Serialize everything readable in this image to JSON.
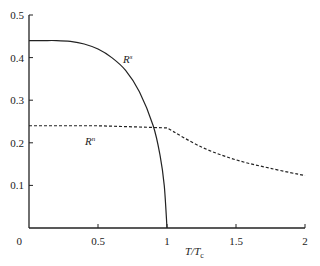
{
  "chart_data": {
    "type": "line",
    "title": "",
    "xlabel": "T/T_c",
    "xlabel_main": "T/T",
    "xlabel_sub": "c",
    "ylabel": "",
    "xlim": [
      0,
      2
    ],
    "ylim": [
      0,
      0.5
    ],
    "grid": false,
    "legend": "inline labels",
    "x_ticks": [
      "0.5",
      "1",
      "1.5",
      "2"
    ],
    "y_ticks": [
      "0.1",
      "0.2",
      "0.3",
      "0.4",
      "0.5"
    ],
    "origin_label": "0",
    "series": [
      {
        "name": "R^s",
        "label_main": "R",
        "label_sup": "s",
        "style": "solid",
        "x": [
          0,
          0.1,
          0.2,
          0.3,
          0.4,
          0.5,
          0.6,
          0.7,
          0.8,
          0.9,
          0.95,
          0.98,
          1.0
        ],
        "values": [
          0.44,
          0.44,
          0.44,
          0.438,
          0.432,
          0.42,
          0.4,
          0.37,
          0.32,
          0.24,
          0.17,
          0.1,
          0.0
        ]
      },
      {
        "name": "R^n",
        "label_main": "R",
        "label_sup": "n",
        "style": "dashed",
        "x": [
          0,
          0.5,
          1.0,
          1.25,
          1.5,
          1.75,
          2.0
        ],
        "values": [
          0.24,
          0.24,
          0.235,
          0.19,
          0.16,
          0.14,
          0.123
        ]
      }
    ]
  }
}
